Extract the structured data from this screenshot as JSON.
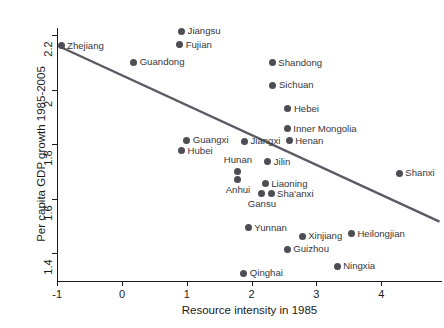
{
  "chart_data": {
    "type": "scatter",
    "title": "",
    "xlabel": "Resource intensity in 1985",
    "ylabel": "Per capita GDP growth 1985-2005",
    "xlim": [
      -1.35,
      4.6
    ],
    "ylim": [
      1.28,
      2.27
    ],
    "xticks": [
      -1,
      0,
      1,
      2,
      3,
      4
    ],
    "xticklabels": [
      "-1",
      "0",
      "1",
      "2",
      "3",
      "4"
    ],
    "yticks": [
      1.4,
      1.6,
      1.8,
      2.0,
      2.2
    ],
    "yticklabels": [
      "1.4",
      "1.6",
      "1.8",
      "2",
      "2.2"
    ],
    "grid": false,
    "legend": false,
    "marker_color": "#4d4d54",
    "line_color": "#5a5a62",
    "axis_color": "#1a1a1a",
    "label_color": "#36363c",
    "points": [
      {
        "name": "Zhejiang",
        "x": -0.94,
        "y": 2.16,
        "label_pos": "right"
      },
      {
        "name": "Jiangsu",
        "x": 0.92,
        "y": 2.213,
        "label_pos": "right"
      },
      {
        "name": "Fujian",
        "x": 0.89,
        "y": 2.165,
        "label_pos": "right"
      },
      {
        "name": "Guandong",
        "x": 0.18,
        "y": 2.1,
        "label_pos": "right"
      },
      {
        "name": "Shandong",
        "x": 2.32,
        "y": 2.098,
        "label_pos": "right"
      },
      {
        "name": "Sichuan",
        "x": 2.33,
        "y": 2.015,
        "label_pos": "right"
      },
      {
        "name": "Hebei",
        "x": 2.56,
        "y": 1.93,
        "label_pos": "right"
      },
      {
        "name": "Inner Mongolia",
        "x": 2.55,
        "y": 1.856,
        "label_pos": "right"
      },
      {
        "name": "Henan",
        "x": 2.58,
        "y": 1.812,
        "label_pos": "right"
      },
      {
        "name": "Guangxi",
        "x": 1.0,
        "y": 1.814,
        "label_pos": "right"
      },
      {
        "name": "Jiangxi",
        "x": 1.89,
        "y": 1.81,
        "label_pos": "right"
      },
      {
        "name": "Hubei",
        "x": 0.92,
        "y": 1.775,
        "label_pos": "right"
      },
      {
        "name": "Jilin",
        "x": 2.25,
        "y": 1.735,
        "label_pos": "right"
      },
      {
        "name": "Hunan",
        "x": 1.79,
        "y": 1.7,
        "label_pos": "above"
      },
      {
        "name": "Anhui",
        "x": 1.79,
        "y": 1.668,
        "label_pos": "below"
      },
      {
        "name": "Liaoning",
        "x": 2.21,
        "y": 1.655,
        "label_pos": "right"
      },
      {
        "name": "Sha'anxi",
        "x": 2.3,
        "y": 1.617,
        "label_pos": "right"
      },
      {
        "name": "Gansu",
        "x": 2.16,
        "y": 1.617,
        "label_pos": "below"
      },
      {
        "name": "Shanxi",
        "x": 4.28,
        "y": 1.692,
        "label_pos": "right"
      },
      {
        "name": "Yunnan",
        "x": 1.95,
        "y": 1.492,
        "label_pos": "right"
      },
      {
        "name": "Xinjiang",
        "x": 2.78,
        "y": 1.462,
        "label_pos": "right"
      },
      {
        "name": "Heilongjian",
        "x": 3.54,
        "y": 1.47,
        "label_pos": "right"
      },
      {
        "name": "Guizhou",
        "x": 2.55,
        "y": 1.414,
        "label_pos": "right"
      },
      {
        "name": "Ningxia",
        "x": 3.32,
        "y": 1.352,
        "label_pos": "right"
      },
      {
        "name": "Qinghai",
        "x": 1.88,
        "y": 1.326,
        "label_pos": "right"
      }
    ],
    "fit_line": {
      "x_start": -0.94,
      "y_start": 2.155,
      "x_end": 4.9,
      "y_end": 1.515
    }
  }
}
